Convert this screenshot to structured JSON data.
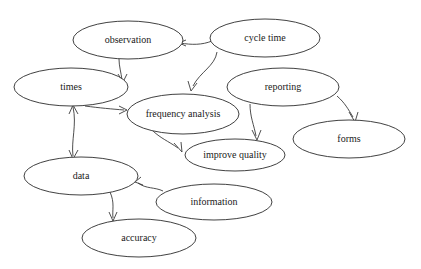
{
  "diagram": {
    "background_color": "#ffffff",
    "node_stroke_color": "#2b2b2b",
    "node_fill_color": "#ffffff",
    "edge_color": "#3a3a3a",
    "text_color": "#1a1a1a",
    "nodes": [
      {
        "id": "observation",
        "label": "observation",
        "cx": 128,
        "cy": 40,
        "rx": 55,
        "ry": 19,
        "font_size": 10
      },
      {
        "id": "cycle-time",
        "label": "cycle time",
        "cx": 265,
        "cy": 38,
        "rx": 55,
        "ry": 19,
        "font_size": 10
      },
      {
        "id": "times",
        "label": "times",
        "cx": 71,
        "cy": 87,
        "rx": 57,
        "ry": 19,
        "font_size": 10
      },
      {
        "id": "reporting",
        "label": "reporting",
        "cx": 283,
        "cy": 87,
        "rx": 56,
        "ry": 19,
        "font_size": 10
      },
      {
        "id": "frequency-analysis",
        "label": "frequency analysis",
        "cx": 183,
        "cy": 114,
        "rx": 56,
        "ry": 20,
        "font_size": 10
      },
      {
        "id": "forms",
        "label": "forms",
        "cx": 349,
        "cy": 139,
        "rx": 56,
        "ry": 19,
        "font_size": 10
      },
      {
        "id": "improve-quality",
        "label": "improve quality",
        "cx": 235,
        "cy": 155,
        "rx": 50,
        "ry": 16,
        "font_size": 10
      },
      {
        "id": "data",
        "label": "data",
        "cx": 81,
        "cy": 176,
        "rx": 57,
        "ry": 19,
        "font_size": 10
      },
      {
        "id": "information",
        "label": "information",
        "cx": 214,
        "cy": 202,
        "rx": 58,
        "ry": 18,
        "font_size": 10
      },
      {
        "id": "accuracy",
        "label": "accuracy",
        "cx": 139,
        "cy": 238,
        "rx": 57,
        "ry": 19,
        "font_size": 10
      }
    ],
    "edges": [
      {
        "id": "edge-cycle-time-observation",
        "from": "cycle time",
        "to": "observation",
        "direction": "single"
      },
      {
        "id": "edge-observation-times",
        "from": "observation",
        "to": "times",
        "direction": "single"
      },
      {
        "id": "edge-cycle-time-frequency-analysis",
        "from": "cycle time",
        "to": "frequency analysis",
        "direction": "single"
      },
      {
        "id": "edge-times-frequency-analysis",
        "from": "times",
        "to": "frequency analysis",
        "direction": "single"
      },
      {
        "id": "edge-reporting-improve-quality",
        "from": "reporting",
        "to": "improve quality",
        "direction": "single"
      },
      {
        "id": "edge-reporting-forms",
        "from": "reporting",
        "to": "forms",
        "direction": "single"
      },
      {
        "id": "edge-frequency-analysis-improve-quality",
        "from": "frequency analysis",
        "to": "improve quality",
        "direction": "single"
      },
      {
        "id": "edge-times-data",
        "from": "times",
        "to": "data",
        "direction": "double"
      },
      {
        "id": "edge-information-data",
        "from": "information",
        "to": "data",
        "direction": "single"
      },
      {
        "id": "edge-data-accuracy",
        "from": "data",
        "to": "accuracy",
        "direction": "single"
      }
    ]
  }
}
